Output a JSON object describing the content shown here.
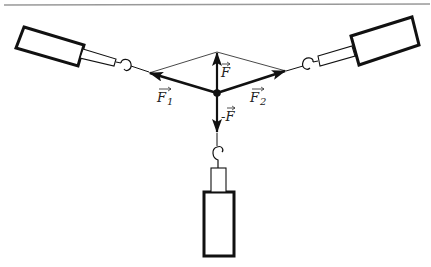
{
  "diagram": {
    "colors": {
      "stroke": "#111111",
      "thin_line": "#333333",
      "rule": "#999999",
      "background": "#ffffff"
    },
    "labels": {
      "F": "F",
      "F1": "F",
      "F1_sub": "1",
      "F2": "F",
      "F2_sub": "2",
      "minusF": "-F"
    },
    "center_point": {
      "x": 217,
      "y": 93
    },
    "vectors": [
      {
        "name": "F1",
        "from": [
          217,
          93
        ],
        "to": [
          149,
          73
        ]
      },
      {
        "name": "F2",
        "from": [
          217,
          93
        ],
        "to": [
          286,
          71
        ]
      },
      {
        "name": "F",
        "from": [
          217,
          93
        ],
        "to": [
          217,
          52
        ]
      },
      {
        "name": "-F",
        "from": [
          217,
          93
        ],
        "to": [
          217,
          133
        ]
      }
    ],
    "spring_scales": [
      {
        "name": "left-scale",
        "direction": "upper-left"
      },
      {
        "name": "right-scale",
        "direction": "upper-right"
      },
      {
        "name": "bottom-scale",
        "direction": "down"
      }
    ]
  }
}
